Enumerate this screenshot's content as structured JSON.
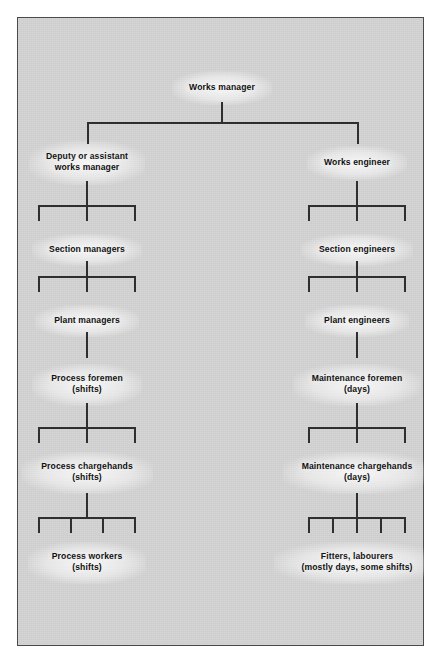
{
  "diagram": {
    "background_color": "#d2d2d2",
    "line_color": "#2f2f2f",
    "text_color": "#111111",
    "root": {
      "label": "Works manager"
    },
    "left_branch": {
      "nodes": [
        {
          "line1": "Deputy or assistant",
          "line2": "works manager"
        },
        {
          "line1": "Section managers",
          "line2": ""
        },
        {
          "line1": "Plant managers",
          "line2": ""
        },
        {
          "line1": "Process foremen",
          "line2": "(shifts)"
        },
        {
          "line1": "Process chargehands",
          "line2": "(shifts)"
        },
        {
          "line1": "Process workers",
          "line2": "(shifts)"
        }
      ]
    },
    "right_branch": {
      "nodes": [
        {
          "line1": "Works engineer",
          "line2": ""
        },
        {
          "line1": "Section engineers",
          "line2": ""
        },
        {
          "line1": "Plant engineers",
          "line2": ""
        },
        {
          "line1": "Maintenance foremen",
          "line2": "(days)"
        },
        {
          "line1": "Maintenance chargehands",
          "line2": "(days)"
        },
        {
          "line1": "Fitters, labourers",
          "line2": "(mostly days, some shifts)"
        }
      ]
    }
  }
}
